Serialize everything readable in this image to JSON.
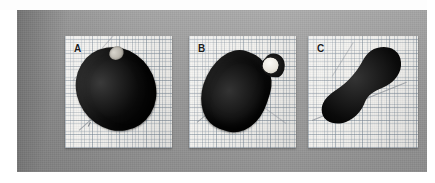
{
  "figure": {
    "medium": "scanned-photograph",
    "background_color": "#9b9b9b",
    "paper_margin_color": "#ffffff",
    "panel_count": 3
  },
  "panels": [
    {
      "label": "A",
      "card_color": "#f2f1ee",
      "grid": "graph-paper",
      "specimen": {
        "name": "dark-oval-specimen",
        "color": "#0c0c0c",
        "orientation": "tilted-left",
        "highlight": {
          "name": "light-spot",
          "color": "#c4c0b7",
          "position": "upper-right"
        }
      },
      "axes": {
        "name": "measurement-axis",
        "color": "#8a8f96",
        "ticks": 1
      }
    },
    {
      "label": "B",
      "card_color": "#f2f1ee",
      "grid": "graph-paper",
      "specimen": {
        "name": "dark-pear-specimen",
        "color": "#0b0b0b",
        "orientation": "tilted-right",
        "highlight": {
          "name": "white-circle-marker",
          "color": "#f7f5f0",
          "position": "upper-right-neck"
        }
      },
      "axes": {
        "name": "measurement-axis",
        "color": "#8a8f96",
        "ticks": 1
      }
    },
    {
      "label": "C",
      "card_color": "#f2f1ee",
      "grid": "graph-paper",
      "specimen": {
        "name": "dark-hook-specimen",
        "color": "#0a0a0a",
        "orientation": "curved-hook",
        "highlight": null
      },
      "axes": {
        "name": "measurement-axis",
        "color": "#8a8f96",
        "ticks": 1
      }
    }
  ]
}
